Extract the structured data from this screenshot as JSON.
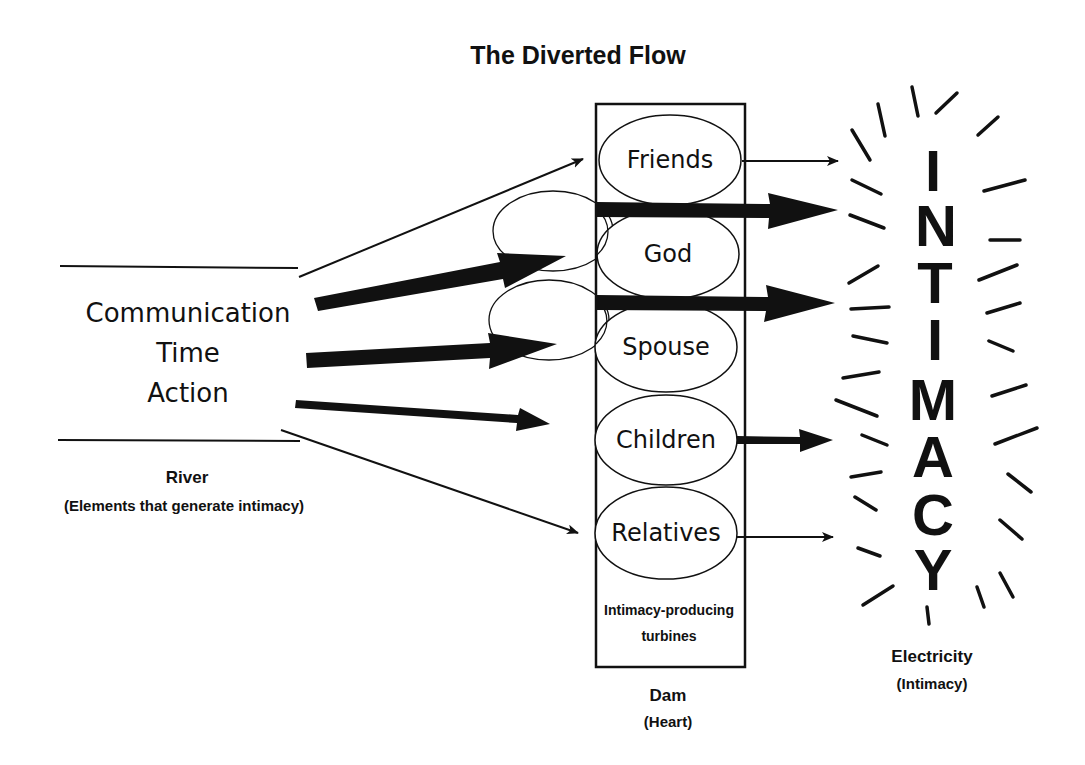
{
  "title": "The Diverted Flow",
  "river": {
    "elements": [
      "Communication",
      "Time",
      "Action"
    ],
    "label": "River",
    "sublabel": "(Elements that generate intimacy)"
  },
  "dam": {
    "turbines": [
      "Friends",
      "God",
      "Spouse",
      "Children",
      "Relatives"
    ],
    "turbine_caption_line1": "Intimacy-producing",
    "turbine_caption_line2": "turbines",
    "label": "Dam",
    "sublabel": "(Heart)"
  },
  "output": {
    "word_letters": [
      "I",
      "N",
      "T",
      "I",
      "M",
      "A",
      "C",
      "Y"
    ],
    "label": "Electricity",
    "sublabel": "(Intimacy)"
  },
  "flows": {
    "incoming": [
      {
        "target": "Friends",
        "weight": "thin"
      },
      {
        "target": "God",
        "weight": "thick"
      },
      {
        "target": "Spouse",
        "weight": "thick"
      },
      {
        "target": "Children",
        "weight": "medium"
      },
      {
        "target": "Relatives",
        "weight": "thin"
      }
    ],
    "outgoing": [
      {
        "source": "Friends",
        "weight": "thin"
      },
      {
        "source": "God",
        "weight": "thick"
      },
      {
        "source": "Spouse",
        "weight": "thick"
      },
      {
        "source": "Children",
        "weight": "medium"
      },
      {
        "source": "Relatives",
        "weight": "thin"
      }
    ]
  },
  "colors": {
    "ink": "#111111",
    "background": "#ffffff"
  }
}
